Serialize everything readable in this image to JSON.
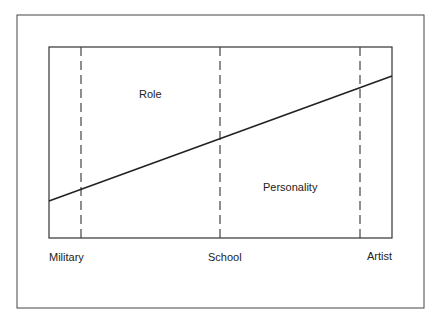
{
  "diagram": {
    "regions": {
      "upper": "Role",
      "lower": "Personality"
    },
    "axis_labels": [
      "Military",
      "School",
      "Artist"
    ],
    "colors": {
      "line": "#222222",
      "border": "#333333",
      "background": "#ffffff"
    }
  }
}
